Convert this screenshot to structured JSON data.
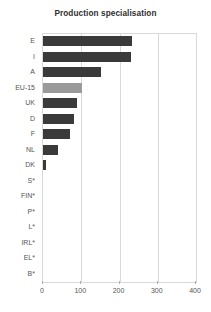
{
  "chart_data": {
    "type": "bar",
    "orientation": "horizontal",
    "title": "Production specialisation",
    "xlabel": "",
    "ylabel": "",
    "xlim": [
      0,
      400
    ],
    "xticks": [
      0,
      100,
      200,
      300,
      400
    ],
    "xtick_labels": [
      "0",
      "100",
      "200",
      "300",
      "400"
    ],
    "grid": true,
    "grid_axis": "x",
    "legend": null,
    "categories": [
      "E",
      "I",
      "A",
      "EU-15",
      "UK",
      "D",
      "F",
      "NL",
      "DK",
      "S*",
      "FIN*",
      "P*",
      "L*",
      "IRL*",
      "EL*",
      "B*"
    ],
    "values": [
      233,
      230,
      152,
      102,
      89,
      81,
      70,
      39,
      8,
      0,
      0,
      0,
      0,
      0,
      0,
      0
    ],
    "bar_colors": [
      "#3a3a3a",
      "#3a3a3a",
      "#3a3a3a",
      "#9a9a9a",
      "#3a3a3a",
      "#3a3a3a",
      "#3a3a3a",
      "#3a3a3a",
      "#3a3a3a",
      "#3a3a3a",
      "#3a3a3a",
      "#3a3a3a",
      "#3a3a3a",
      "#3a3a3a",
      "#3a3a3a",
      "#3a3a3a"
    ],
    "highlight_category": "EU-15",
    "colors": {
      "bar": "#3a3a3a",
      "bar_highlight": "#9a9a9a",
      "grid": "#d9d9d9",
      "axis_text": "#555555",
      "title_text": "#2e2e2e",
      "background": "#ffffff"
    }
  }
}
